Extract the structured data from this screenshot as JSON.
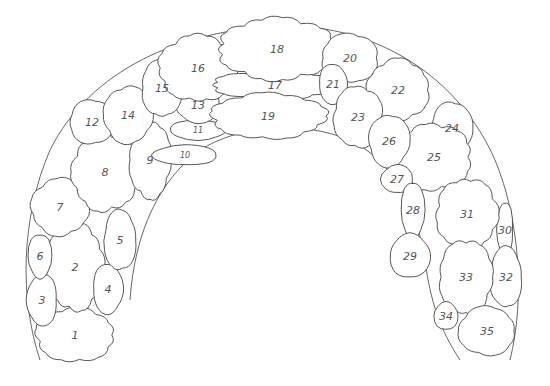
{
  "diagram": {
    "type": "numbered-region-map",
    "shape": "arch",
    "stroke_color": "#444444",
    "label_color": "#555555",
    "background": "#ffffff",
    "regions": [
      {
        "id": "1",
        "x": 75,
        "y": 335,
        "rx": 38,
        "ry": 26
      },
      {
        "id": "2",
        "x": 75,
        "y": 267,
        "rx": 28,
        "ry": 42
      },
      {
        "id": "3",
        "x": 42,
        "y": 300,
        "rx": 15,
        "ry": 26
      },
      {
        "id": "4",
        "x": 108,
        "y": 289,
        "rx": 15,
        "ry": 25
      },
      {
        "id": "5",
        "x": 120,
        "y": 240,
        "rx": 16,
        "ry": 30
      },
      {
        "id": "6",
        "x": 40,
        "y": 256,
        "rx": 12,
        "ry": 22
      },
      {
        "id": "7",
        "x": 60,
        "y": 207,
        "rx": 28,
        "ry": 28
      },
      {
        "id": "8",
        "x": 105,
        "y": 172,
        "rx": 32,
        "ry": 38
      },
      {
        "id": "9",
        "x": 150,
        "y": 160,
        "rx": 20,
        "ry": 38
      },
      {
        "id": "10",
        "x": 185,
        "y": 155,
        "rx": 32,
        "ry": 10
      },
      {
        "id": "11",
        "x": 198,
        "y": 130,
        "rx": 28,
        "ry": 10
      },
      {
        "id": "12",
        "x": 92,
        "y": 122,
        "rx": 22,
        "ry": 22
      },
      {
        "id": "13",
        "x": 198,
        "y": 105,
        "rx": 22,
        "ry": 18
      },
      {
        "id": "14",
        "x": 128,
        "y": 115,
        "rx": 24,
        "ry": 28
      },
      {
        "id": "15",
        "x": 162,
        "y": 88,
        "rx": 20,
        "ry": 28
      },
      {
        "id": "16",
        "x": 198,
        "y": 68,
        "rx": 38,
        "ry": 32
      },
      {
        "id": "17",
        "x": 275,
        "y": 85,
        "rx": 60,
        "ry": 14
      },
      {
        "id": "18",
        "x": 277,
        "y": 49,
        "rx": 56,
        "ry": 30
      },
      {
        "id": "19",
        "x": 268,
        "y": 116,
        "rx": 55,
        "ry": 22
      },
      {
        "id": "20",
        "x": 350,
        "y": 58,
        "rx": 28,
        "ry": 24
      },
      {
        "id": "21",
        "x": 333,
        "y": 84,
        "rx": 14,
        "ry": 20
      },
      {
        "id": "22",
        "x": 398,
        "y": 90,
        "rx": 30,
        "ry": 30
      },
      {
        "id": "23",
        "x": 358,
        "y": 117,
        "rx": 24,
        "ry": 30
      },
      {
        "id": "24",
        "x": 452,
        "y": 128,
        "rx": 20,
        "ry": 26
      },
      {
        "id": "25",
        "x": 434,
        "y": 157,
        "rx": 36,
        "ry": 32
      },
      {
        "id": "26",
        "x": 389,
        "y": 141,
        "rx": 20,
        "ry": 26
      },
      {
        "id": "27",
        "x": 397,
        "y": 179,
        "rx": 16,
        "ry": 14
      },
      {
        "id": "28",
        "x": 413,
        "y": 210,
        "rx": 12,
        "ry": 28
      },
      {
        "id": "29",
        "x": 410,
        "y": 256,
        "rx": 20,
        "ry": 22
      },
      {
        "id": "30",
        "x": 505,
        "y": 230,
        "rx": 8,
        "ry": 28
      },
      {
        "id": "31",
        "x": 467,
        "y": 214,
        "rx": 30,
        "ry": 34
      },
      {
        "id": "32",
        "x": 506,
        "y": 277,
        "rx": 16,
        "ry": 30
      },
      {
        "id": "33",
        "x": 466,
        "y": 277,
        "rx": 26,
        "ry": 36
      },
      {
        "id": "34",
        "x": 446,
        "y": 316,
        "rx": 12,
        "ry": 14
      },
      {
        "id": "35",
        "x": 487,
        "y": 331,
        "rx": 28,
        "ry": 24
      }
    ]
  }
}
